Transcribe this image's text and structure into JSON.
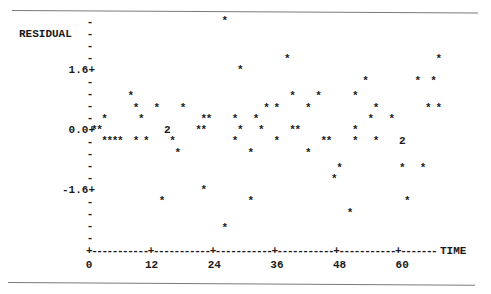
{
  "chart_data": {
    "type": "scatter",
    "title": "",
    "xlabel": "TIME",
    "ylabel": "RESIDUAL",
    "x_ticks": [
      0,
      12,
      24,
      36,
      48,
      60
    ],
    "y_ticks": [
      1.6,
      0.0,
      -1.6
    ],
    "y_tick_labels": [
      "1.6+",
      "0.0+",
      "-1.6+"
    ],
    "xlim": [
      0,
      68
    ],
    "ylim": [
      -2.9,
      2.9
    ],
    "grid": false,
    "legend": "none",
    "marker": "*",
    "multiplicity_marker_note": "2 = two coincident points",
    "points": [
      {
        "x": 1,
        "y": 0.0
      },
      {
        "x": 2,
        "y": 0.0
      },
      {
        "x": 3,
        "y": 0.3
      },
      {
        "x": 3,
        "y": -0.3
      },
      {
        "x": 4,
        "y": -0.3
      },
      {
        "x": 5,
        "y": -0.3
      },
      {
        "x": 6,
        "y": -0.3
      },
      {
        "x": 8,
        "y": 0.9
      },
      {
        "x": 9,
        "y": 0.6
      },
      {
        "x": 9,
        "y": -0.3
      },
      {
        "x": 10,
        "y": 0.3
      },
      {
        "x": 11,
        "y": -0.3
      },
      {
        "x": 13,
        "y": 0.6
      },
      {
        "x": 14,
        "y": -1.9
      },
      {
        "x": 15,
        "y": 0.0,
        "count": 2
      },
      {
        "x": 16,
        "y": -0.3
      },
      {
        "x": 17,
        "y": -0.6
      },
      {
        "x": 18,
        "y": 0.6
      },
      {
        "x": 21,
        "y": 0.0
      },
      {
        "x": 22,
        "y": 0.0
      },
      {
        "x": 22,
        "y": -1.6
      },
      {
        "x": 22,
        "y": 0.3
      },
      {
        "x": 23,
        "y": 0.3
      },
      {
        "x": 26,
        "y": 2.9
      },
      {
        "x": 26,
        "y": -2.6
      },
      {
        "x": 28,
        "y": 0.3
      },
      {
        "x": 28,
        "y": -0.3
      },
      {
        "x": 29,
        "y": 1.6
      },
      {
        "x": 29,
        "y": 0.0
      },
      {
        "x": 31,
        "y": -0.6
      },
      {
        "x": 31,
        "y": -1.9
      },
      {
        "x": 32,
        "y": 0.3
      },
      {
        "x": 33,
        "y": 0.0
      },
      {
        "x": 34,
        "y": 0.6
      },
      {
        "x": 36,
        "y": -0.3
      },
      {
        "x": 36,
        "y": 0.6
      },
      {
        "x": 38,
        "y": 1.9
      },
      {
        "x": 39,
        "y": 0.9
      },
      {
        "x": 39,
        "y": 0.0
      },
      {
        "x": 40,
        "y": 0.0
      },
      {
        "x": 42,
        "y": 0.6
      },
      {
        "x": 42,
        "y": -0.6
      },
      {
        "x": 44,
        "y": 0.9
      },
      {
        "x": 45,
        "y": -0.3
      },
      {
        "x": 46,
        "y": -0.3
      },
      {
        "x": 47,
        "y": -1.3
      },
      {
        "x": 48,
        "y": -1.0
      },
      {
        "x": 50,
        "y": -2.2
      },
      {
        "x": 51,
        "y": 0.9
      },
      {
        "x": 51,
        "y": 0.0
      },
      {
        "x": 51,
        "y": -0.3
      },
      {
        "x": 53,
        "y": 1.3
      },
      {
        "x": 54,
        "y": 0.3
      },
      {
        "x": 55,
        "y": 0.6
      },
      {
        "x": 55,
        "y": -0.3
      },
      {
        "x": 58,
        "y": 0.3
      },
      {
        "x": 60,
        "y": -0.3,
        "count": 2
      },
      {
        "x": 60,
        "y": -1.0
      },
      {
        "x": 61,
        "y": -1.9
      },
      {
        "x": 63,
        "y": 1.3
      },
      {
        "x": 64,
        "y": -1.0
      },
      {
        "x": 65,
        "y": 0.6
      },
      {
        "x": 66,
        "y": 1.3
      },
      {
        "x": 67,
        "y": 1.9
      },
      {
        "x": 67,
        "y": 0.6
      }
    ]
  },
  "plot": {
    "ylabel": "RESIDUAL",
    "xlabel": "TIME",
    "x_tick_labels": [
      "0",
      "12",
      "24",
      "36",
      "48",
      "60"
    ],
    "y_tick_labels": [
      "1.6+",
      "0.0+",
      "-1.6+"
    ],
    "point_glyph": "*",
    "double_glyph": "2",
    "tick_dash": "-"
  }
}
